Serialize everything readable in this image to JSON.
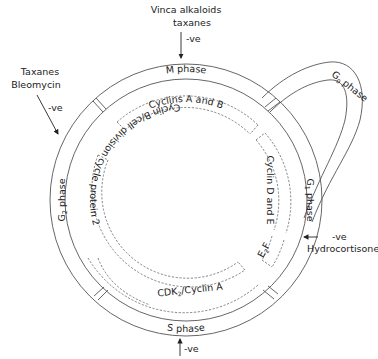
{
  "diagram": {
    "type": "cell-cycle",
    "phases": [
      {
        "id": "m",
        "label": "M phase"
      },
      {
        "id": "g1",
        "label": "G",
        "sub": "1",
        "suffix": " phase"
      },
      {
        "id": "s",
        "label": "S phase"
      },
      {
        "id": "g2",
        "label": "G",
        "sub": "2",
        "suffix": " phase"
      },
      {
        "id": "g0",
        "label": "G",
        "sub": "0",
        "suffix": " phase"
      }
    ],
    "regulators": [
      {
        "id": "cyclins-a-b",
        "label": "Cyclins A and B"
      },
      {
        "id": "cyclin-d-e",
        "label": "Cyclin D and E"
      },
      {
        "id": "e2f",
        "label": "E",
        "sub": "2",
        "suffix": "F"
      },
      {
        "id": "cdk2-cyclin-a",
        "label": "CDK",
        "sub": "2",
        "suffix": "/Cyclin A"
      },
      {
        "id": "cyclin-b-cdc2",
        "label": "Cyclin B/cell division cycle protein 2"
      }
    ],
    "inhibitors": [
      {
        "id": "vinca",
        "line1": "Vinca alkaloids",
        "line2": "taxanes",
        "effect": "-ve"
      },
      {
        "id": "taxanes-bleo",
        "line1": "Taxanes",
        "line2": "Bleomycin",
        "effect": "-ve"
      },
      {
        "id": "hydrocortisone",
        "line1": "Hydrocortisone",
        "effect": "-ve"
      },
      {
        "id": "s-phase-inhibitor",
        "effect": "-ve"
      }
    ]
  }
}
